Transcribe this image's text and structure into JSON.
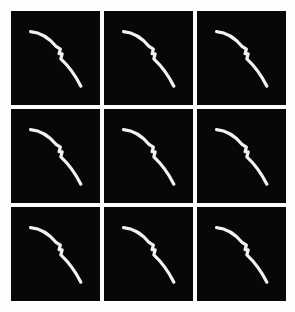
{
  "figure": {
    "kind": "image-grid",
    "rows": 3,
    "columns": 3,
    "background_color": "#fdfdfd",
    "panel_color": "#070707",
    "stroke_color": "#f2f2f2",
    "gutter_color": "#fbfbfb"
  },
  "chart_data": {
    "type": "line",
    "title": "",
    "subtitle": "",
    "xlabel": "",
    "ylabel": "",
    "grid": false,
    "legend": null,
    "axis_visible": false,
    "tick_labels_x": [],
    "tick_labels_y": [],
    "xlim": [
      0,
      100
    ],
    "ylim": [
      0,
      100
    ],
    "panel_count": 9,
    "series": [
      {
        "name": "panel-1",
        "x": [
          22,
          30,
          39,
          47,
          53,
          56,
          58,
          55,
          57,
          61,
          65,
          70,
          75,
          78,
          79
        ],
        "y": [
          22,
          24,
          28,
          33,
          37,
          40,
          45,
          47,
          51,
          55,
          60,
          66,
          72,
          77,
          80
        ]
      },
      {
        "name": "panel-2",
        "x": [
          22,
          30,
          39,
          47,
          53,
          56,
          58,
          55,
          57,
          61,
          65,
          70,
          75,
          78,
          79
        ],
        "y": [
          22,
          24,
          28,
          33,
          37,
          40,
          45,
          47,
          51,
          55,
          60,
          66,
          72,
          77,
          80
        ]
      },
      {
        "name": "panel-3",
        "x": [
          22,
          30,
          39,
          47,
          53,
          56,
          58,
          55,
          57,
          61,
          65,
          70,
          75,
          78,
          79
        ],
        "y": [
          22,
          24,
          28,
          33,
          37,
          40,
          45,
          47,
          51,
          55,
          60,
          66,
          72,
          77,
          80
        ]
      },
      {
        "name": "panel-4",
        "x": [
          22,
          30,
          39,
          47,
          53,
          56,
          58,
          55,
          57,
          61,
          65,
          70,
          75,
          78,
          79
        ],
        "y": [
          22,
          24,
          28,
          33,
          37,
          40,
          45,
          47,
          51,
          55,
          60,
          66,
          72,
          77,
          80
        ]
      },
      {
        "name": "panel-5",
        "x": [
          22,
          30,
          39,
          47,
          53,
          56,
          58,
          55,
          57,
          61,
          65,
          70,
          75,
          78,
          79
        ],
        "y": [
          22,
          24,
          28,
          33,
          37,
          40,
          45,
          47,
          51,
          55,
          60,
          66,
          72,
          77,
          80
        ]
      },
      {
        "name": "panel-6",
        "x": [
          22,
          30,
          39,
          47,
          53,
          56,
          58,
          55,
          57,
          61,
          65,
          70,
          75,
          78,
          79
        ],
        "y": [
          22,
          24,
          28,
          33,
          37,
          40,
          45,
          47,
          51,
          55,
          60,
          66,
          72,
          77,
          80
        ]
      },
      {
        "name": "panel-7",
        "x": [
          22,
          30,
          39,
          47,
          53,
          56,
          58,
          55,
          57,
          61,
          65,
          70,
          75,
          78,
          79
        ],
        "y": [
          22,
          24,
          28,
          33,
          37,
          40,
          45,
          47,
          51,
          55,
          60,
          66,
          72,
          77,
          80
        ]
      },
      {
        "name": "panel-8",
        "x": [
          22,
          30,
          39,
          47,
          53,
          56,
          58,
          55,
          57,
          61,
          65,
          70,
          75,
          78,
          79
        ],
        "y": [
          22,
          24,
          28,
          33,
          37,
          40,
          45,
          47,
          51,
          55,
          60,
          66,
          72,
          77,
          80
        ]
      },
      {
        "name": "panel-9",
        "x": [
          22,
          30,
          39,
          47,
          53,
          56,
          58,
          55,
          57,
          61,
          65,
          70,
          75,
          78,
          79
        ],
        "y": [
          22,
          24,
          28,
          33,
          37,
          40,
          45,
          47,
          51,
          55,
          60,
          66,
          72,
          77,
          80
        ]
      }
    ]
  },
  "panels": [
    {
      "id": "panel-1",
      "row": 1,
      "col": 1,
      "path": "M 22 22 C 34 23 44 30 51 38 L 55.5 40.5 L 54 45.5 L 57.5 45.5 L 56 51 C 64 58 72 68 78.5 80"
    },
    {
      "id": "panel-2",
      "row": 1,
      "col": 2,
      "path": "M 22 22 C 34 23 44 30 51 38 L 55.5 40.5 L 54 45.5 L 57.5 45.5 L 56 51 C 64 58 72 68 78.5 80"
    },
    {
      "id": "panel-3",
      "row": 1,
      "col": 3,
      "path": "M 22 22 C 34 23 44 30 51 38 L 55.5 40.5 L 54 45.5 L 57.5 45.5 L 56 51 C 64 58 72 68 78.5 80"
    },
    {
      "id": "panel-4",
      "row": 2,
      "col": 1,
      "path": "M 22 22 C 34 23 44 30 51 38 L 55.5 40.5 L 54 45.5 L 57.5 45.5 L 56 51 C 64 58 72 68 78.5 80"
    },
    {
      "id": "panel-5",
      "row": 2,
      "col": 2,
      "path": "M 22 22 C 34 23 44 30 51 38 L 55.5 40.5 L 54 45.5 L 57.5 45.5 L 56 51 C 64 58 72 68 78.5 80"
    },
    {
      "id": "panel-6",
      "row": 2,
      "col": 3,
      "path": "M 22 22 C 34 23 44 30 51 38 L 55.5 40.5 L 54 45.5 L 57.5 45.5 L 56 51 C 64 58 72 68 78.5 80"
    },
    {
      "id": "panel-7",
      "row": 3,
      "col": 1,
      "path": "M 22 22 C 34 23 44 30 51 38 L 55.5 40.5 L 54 45.5 L 57.5 45.5 L 56 51 C 64 58 72 68 78.5 80"
    },
    {
      "id": "panel-8",
      "row": 3,
      "col": 2,
      "path": "M 22 22 C 34 23 44 30 51 38 L 55.5 40.5 L 54 45.5 L 57.5 45.5 L 56 51 C 64 58 72 68 78.5 80"
    },
    {
      "id": "panel-9",
      "row": 3,
      "col": 3,
      "path": "M 22 22 C 34 23 44 30 51 38 L 55.5 40.5 L 54 45.5 L 57.5 45.5 L 56 51 C 64 58 72 68 78.5 80"
    }
  ]
}
